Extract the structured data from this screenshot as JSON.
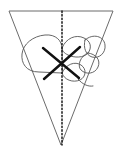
{
  "figure": {
    "canvas": {
      "width": 122,
      "height": 152,
      "background": "#ffffff"
    },
    "colors": {
      "outline": "#6b6b6b",
      "shape_outline": "#555555",
      "dotted_line": "#1a1a1a",
      "cross_mark": "#111111",
      "background": "#ffffff"
    },
    "elements": {
      "triangle": {
        "name": "inverted-triangle",
        "description": "downward pointing triangle / cone outline",
        "points": "9,11 113,11 61,145",
        "stroke_width": 1
      },
      "symmetry_line": {
        "name": "dotted-vertical-symmetry-line",
        "description": "dotted vertical line from top edge to apex",
        "x": 62,
        "y_top": 11,
        "y_bottom": 145,
        "dash": "1.4 2.2",
        "stroke_width": 1.5
      },
      "left_lobe": {
        "name": "left-wing-lobe",
        "description": "simple rounded lobe on left of axis",
        "path": "M 62,73 L 39,72 C 26,72 21,63 22,54 C 23,44 33,36 45,35 C 56,34 62,41 62,48 Z",
        "stroke_width": 0.9
      },
      "right_lobes": [
        {
          "name": "right-wing-upper-lobe",
          "path": "M 62,48 C 66,38 76,34 84,38 C 91,41 92,48 88,53 C 84,58 74,58 68,55 C 64,53 62,51 62,48 Z",
          "stroke_width": 0.9
        },
        {
          "name": "right-wing-outer-lobe",
          "path": "M 85,40 C 93,33 104,36 105,45 C 106,53 99,59 92,57 C 86,55 83,48 85,40 Z",
          "stroke_width": 0.9
        },
        {
          "name": "right-wing-mid-lobe",
          "path": "M 88,53 C 96,54 101,60 98,67 C 95,74 86,75 81,70 C 77,66 80,56 88,53 Z",
          "stroke_width": 0.9
        },
        {
          "name": "right-wing-lower-lobe",
          "path": "M 62,73 C 66,64 75,61 81,65 C 87,69 86,77 80,80 C 73,83 64,80 62,73 Z",
          "stroke_width": 0.9
        },
        {
          "name": "right-wing-petal-tail",
          "path": "M 78,79 C 82,84 88,87 93,86",
          "stroke_width": 0.9
        }
      ],
      "cross_mark": {
        "name": "cross-out-x-mark",
        "description": "bold hand-drawn X crossing out the dotted symmetry line",
        "stroke_1": {
          "x1": 43,
          "y1": 48,
          "x2": 79,
          "y2": 78
        },
        "stroke_2": {
          "x1": 80,
          "y1": 47,
          "x2": 44,
          "y2": 79
        },
        "stroke_width": 2.4
      }
    }
  }
}
